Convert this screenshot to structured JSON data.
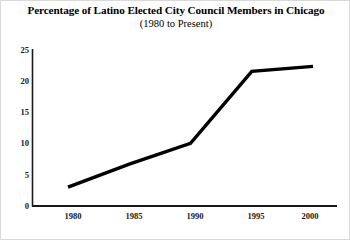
{
  "chart_data": {
    "type": "line",
    "title": "Percentage of Latino Elected City Council Members in Chicago",
    "subtitle": "(1980 to Present)",
    "xlabel": "",
    "ylabel": "",
    "x": [
      1980,
      1985,
      1990,
      1995,
      2000
    ],
    "categories": [
      "1980",
      "1985",
      "1990",
      "1995",
      "2000"
    ],
    "values": [
      3,
      6.7,
      10,
      21.5,
      22.3
    ],
    "series": [
      {
        "name": "Percentage of Latino Elected City Council Members",
        "values": [
          3,
          6.7,
          10,
          21.5,
          22.3
        ]
      }
    ],
    "xlim": [
      1980,
      2000
    ],
    "ylim": [
      0,
      25
    ],
    "ytick_labels": [
      "0",
      "5",
      "10",
      "15",
      "20",
      "25"
    ],
    "ytick_values": [
      0,
      5,
      10,
      15,
      20,
      25
    ],
    "xtick_labels": [
      "1980",
      "1985",
      "1990",
      "1995",
      "2000"
    ],
    "grid": false,
    "legend": "none",
    "markers": false,
    "line_color": "#000000",
    "line_width": 3,
    "axis_color": "#1a1a1a",
    "background_color": "#ffffff",
    "border_color": "#d9d9d9"
  },
  "yticks": [
    {
      "label": "25"
    },
    {
      "label": "20"
    },
    {
      "label": "15"
    },
    {
      "label": "10"
    },
    {
      "label": "5"
    },
    {
      "label": "0"
    }
  ],
  "xticks": [
    {
      "label": "1980"
    },
    {
      "label": "1985"
    },
    {
      "label": "1990"
    },
    {
      "label": "1995"
    },
    {
      "label": "2000"
    }
  ]
}
